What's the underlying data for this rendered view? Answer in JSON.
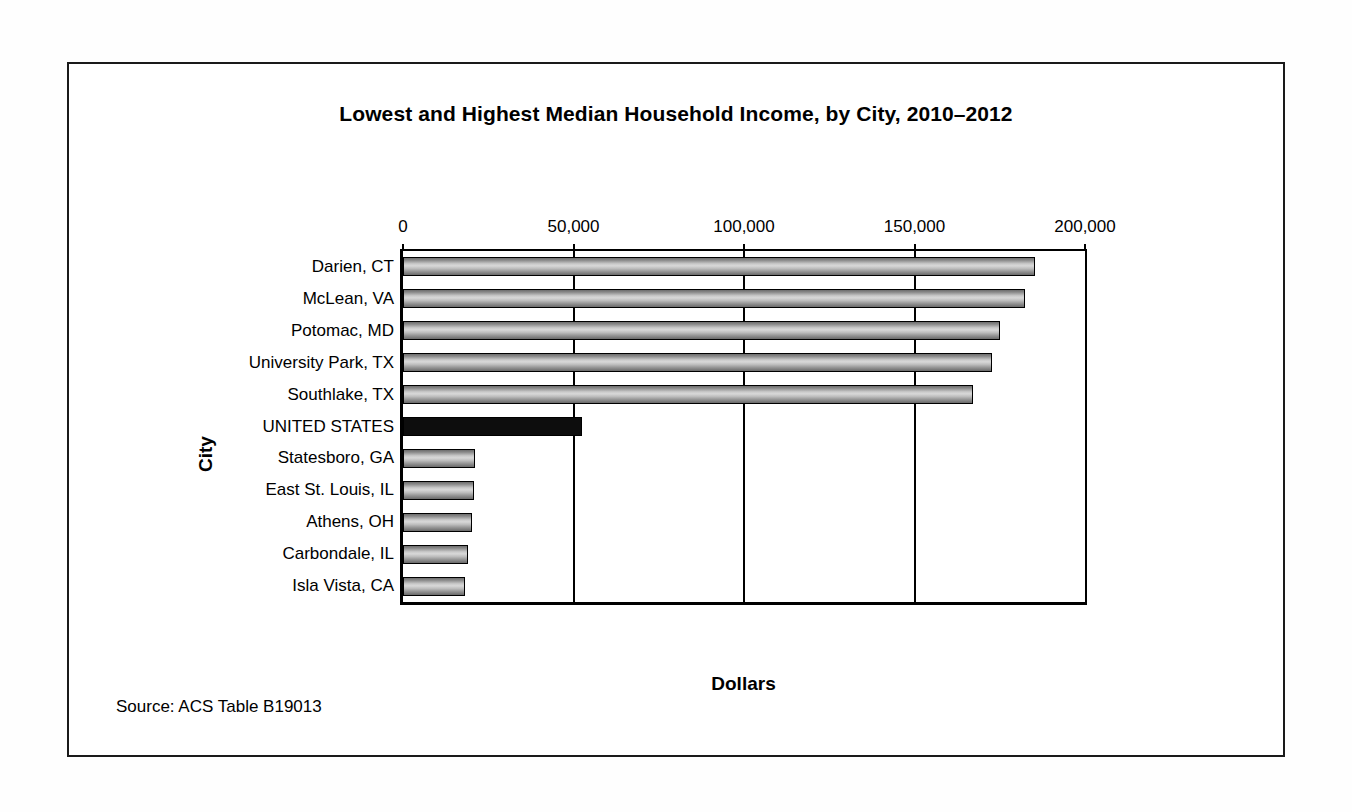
{
  "chart_data": {
    "type": "bar",
    "orientation": "horizontal",
    "title": "Lowest and Highest Median Household Income, by City, 2010–2012",
    "xlabel": "Dollars",
    "ylabel": "City",
    "xlim": [
      0,
      200000
    ],
    "xticks": [
      0,
      50000,
      100000,
      150000,
      200000
    ],
    "xtick_labels": [
      "0",
      "50,000",
      "100,000",
      "150,000",
      "200,000"
    ],
    "grid": true,
    "legend": null,
    "source_note": "Source: ACS Table B19013",
    "categories": [
      "Darien, CT",
      "McLean, VA",
      "Potomac, MD",
      "University Park, TX",
      "Southlake, TX",
      "UNITED STATES",
      "Statesboro, GA",
      "East St. Louis, IL",
      "Athens, OH",
      "Carbondale, IL",
      "Isla Vista, CA"
    ],
    "values": [
      185400,
      182500,
      175200,
      172800,
      167300,
      52400,
      21000,
      20700,
      20100,
      19200,
      18300
    ],
    "highlight_category": "UNITED STATES",
    "highlight_color": "#0d0d0d",
    "bar_color": "#c0c0c0",
    "bar_edge_color": "#000000"
  }
}
